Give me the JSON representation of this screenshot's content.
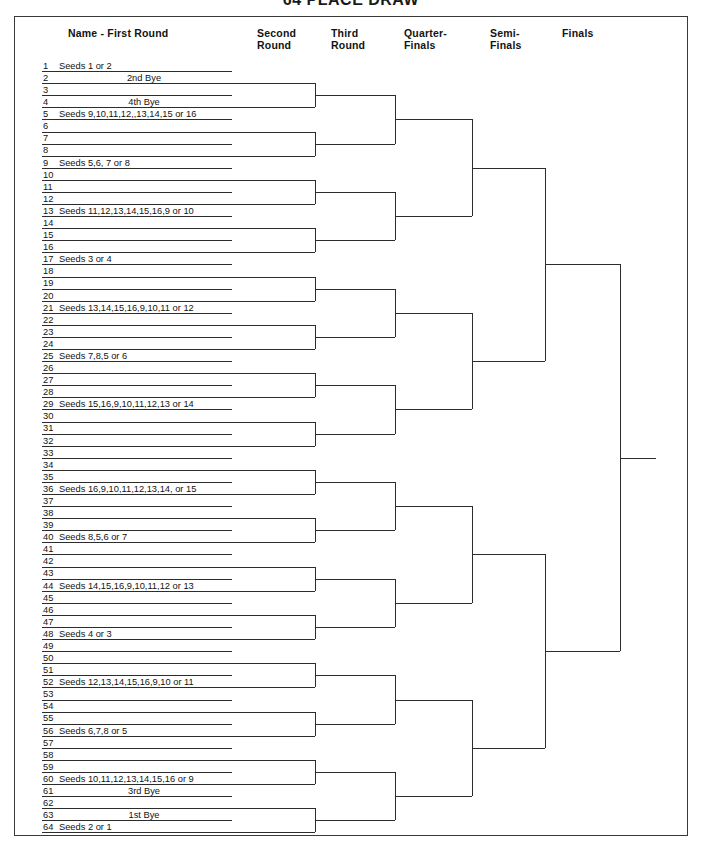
{
  "document": {
    "title": "64 PLACE DRAW",
    "title_visible_partial": true
  },
  "headers": [
    {
      "id": "first-round",
      "label": "Name - First  Round",
      "x": 68,
      "y": 28,
      "align": "left"
    },
    {
      "id": "second-round",
      "label": "Second\nRound",
      "x": 257,
      "y": 28,
      "align": "left"
    },
    {
      "id": "third-round",
      "label": "Third\nRound",
      "x": 331,
      "y": 28,
      "align": "left"
    },
    {
      "id": "quarter-finals",
      "label": "Quarter-\nFinals",
      "x": 404,
      "y": 28,
      "align": "left"
    },
    {
      "id": "semi-finals",
      "label": "Semi-\nFinals",
      "x": 490,
      "y": 28,
      "align": "left"
    },
    {
      "id": "finals",
      "label": "Finals",
      "x": 562,
      "y": 28,
      "align": "left"
    }
  ],
  "geometry": {
    "row_count": 64,
    "first_row_top": 59.0,
    "row_pitch": 12.085,
    "name_line_left": 42,
    "name_line_right": 232,
    "col_x": {
      "second_round": 315,
      "third_round": 395,
      "quarter_finals": 472,
      "semi_finals": 545,
      "finals": 620,
      "champion_end": 656
    },
    "frame": {
      "left": 14,
      "top": 16,
      "width": 674,
      "height": 820
    }
  },
  "rows": [
    {
      "n": "1",
      "label": "Seeds 1 or 2",
      "align": "left"
    },
    {
      "n": "2",
      "label": "2nd Bye",
      "align": "center"
    },
    {
      "n": "3",
      "label": "",
      "align": "left"
    },
    {
      "n": "4",
      "label": "4th Bye",
      "align": "center"
    },
    {
      "n": "5",
      "label": "Seeds 9,10,11,12,,13,14,15 or 16",
      "align": "left"
    },
    {
      "n": "6",
      "label": "",
      "align": "left"
    },
    {
      "n": "7",
      "label": "",
      "align": "left"
    },
    {
      "n": "8",
      "label": "",
      "align": "left"
    },
    {
      "n": "9",
      "label": "Seeds 5,6, 7 or 8",
      "align": "left"
    },
    {
      "n": "10",
      "label": "",
      "align": "left"
    },
    {
      "n": "11",
      "label": "",
      "align": "left"
    },
    {
      "n": "12",
      "label": "",
      "align": "left"
    },
    {
      "n": "13",
      "label": "Seeds 11,12,13,14,15,16,9 or 10",
      "align": "left"
    },
    {
      "n": "14",
      "label": "",
      "align": "left"
    },
    {
      "n": "15",
      "label": "",
      "align": "left"
    },
    {
      "n": "16",
      "label": "",
      "align": "left"
    },
    {
      "n": "17",
      "label": "Seeds 3 or 4",
      "align": "left"
    },
    {
      "n": "18",
      "label": "",
      "align": "left"
    },
    {
      "n": "19",
      "label": "",
      "align": "left"
    },
    {
      "n": "20",
      "label": "",
      "align": "left"
    },
    {
      "n": "21",
      "label": "Seeds 13,14,15,16,9,10,11 or 12",
      "align": "left"
    },
    {
      "n": "22",
      "label": "",
      "align": "left"
    },
    {
      "n": "23",
      "label": "",
      "align": "left"
    },
    {
      "n": "24",
      "label": "",
      "align": "left"
    },
    {
      "n": "25",
      "label": "Seeds 7,8,5 or 6",
      "align": "left"
    },
    {
      "n": "26",
      "label": "",
      "align": "left"
    },
    {
      "n": "27",
      "label": "",
      "align": "left"
    },
    {
      "n": "28",
      "label": "",
      "align": "left"
    },
    {
      "n": "29",
      "label": "Seeds 15,16,9,10,11,12,13 or 14",
      "align": "left"
    },
    {
      "n": "30",
      "label": "",
      "align": "left"
    },
    {
      "n": "31",
      "label": "",
      "align": "left"
    },
    {
      "n": "32",
      "label": "",
      "align": "left"
    },
    {
      "n": "33",
      "label": "",
      "align": "left"
    },
    {
      "n": "34",
      "label": "",
      "align": "left"
    },
    {
      "n": "35",
      "label": "",
      "align": "left"
    },
    {
      "n": "36",
      "label": "Seeds 16,9,10,11,12,13,14, or 15",
      "align": "left"
    },
    {
      "n": "37",
      "label": "",
      "align": "left"
    },
    {
      "n": "38",
      "label": "",
      "align": "left"
    },
    {
      "n": "39",
      "label": "",
      "align": "left"
    },
    {
      "n": "40",
      "label": "Seeds 8,5,6 or 7",
      "align": "left"
    },
    {
      "n": "41",
      "label": "",
      "align": "left"
    },
    {
      "n": "42",
      "label": "",
      "align": "left"
    },
    {
      "n": "43",
      "label": "",
      "align": "left"
    },
    {
      "n": "44",
      "label": "Seeds 14,15,16,9,10,11,12 or 13",
      "align": "left"
    },
    {
      "n": "45",
      "label": "",
      "align": "left"
    },
    {
      "n": "46",
      "label": "",
      "align": "left"
    },
    {
      "n": "47",
      "label": "",
      "align": "left"
    },
    {
      "n": "48",
      "label": "Seeds 4 or 3",
      "align": "left"
    },
    {
      "n": "49",
      "label": "",
      "align": "left"
    },
    {
      "n": "50",
      "label": "",
      "align": "left"
    },
    {
      "n": "51",
      "label": "",
      "align": "left"
    },
    {
      "n": "52",
      "label": "Seeds 12,13,14,15,16,9,10 or 11",
      "align": "left"
    },
    {
      "n": "53",
      "label": "",
      "align": "left"
    },
    {
      "n": "54",
      "label": "",
      "align": "left"
    },
    {
      "n": "55",
      "label": "",
      "align": "left"
    },
    {
      "n": "56",
      "label": "Seeds 6,7,8 or 5",
      "align": "left"
    },
    {
      "n": "57",
      "label": "",
      "align": "left"
    },
    {
      "n": "58",
      "label": "",
      "align": "left"
    },
    {
      "n": "59",
      "label": "",
      "align": "left"
    },
    {
      "n": "60",
      "label": "Seeds 10,11,12,13,14,15,16 or 9",
      "align": "left"
    },
    {
      "n": "61",
      "label": "3rd Bye",
      "align": "center"
    },
    {
      "n": "62",
      "label": "",
      "align": "left"
    },
    {
      "n": "63",
      "label": "1st Bye",
      "align": "center"
    },
    {
      "n": "64",
      "label": "Seeds 2 or 1",
      "align": "left"
    }
  ]
}
